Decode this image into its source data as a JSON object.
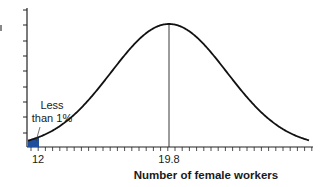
{
  "chart_data": {
    "type": "area",
    "title": "",
    "xlabel": "Number of female workers",
    "ylabel": "",
    "x_ticks_labeled": [
      12,
      19.8
    ],
    "x_tick_labels": [
      "12",
      "19.8"
    ],
    "mean": 19.8,
    "distribution": "normal",
    "shaded_region": {
      "from": "left tail",
      "to": 12,
      "color": "#1f4e9c",
      "label": "Less than 1%"
    },
    "annotations": [
      {
        "text_line1": "Less",
        "text_line2": "than 1%",
        "points_to": "shaded left tail at 12"
      }
    ],
    "mean_line": {
      "x": 19.8,
      "style": "vertical thin line from axis to peak"
    },
    "y_axis": {
      "ticks": 10,
      "labels": "none"
    },
    "grid": false,
    "legend": "none"
  },
  "labels": {
    "x12": "12",
    "xmean": "19.8",
    "xlabel": "Number of female workers",
    "annot1": "Less",
    "annot2": "than 1%"
  },
  "colors": {
    "curve": "#111111",
    "shade": "#1f4e9c",
    "axis": "#222222"
  }
}
